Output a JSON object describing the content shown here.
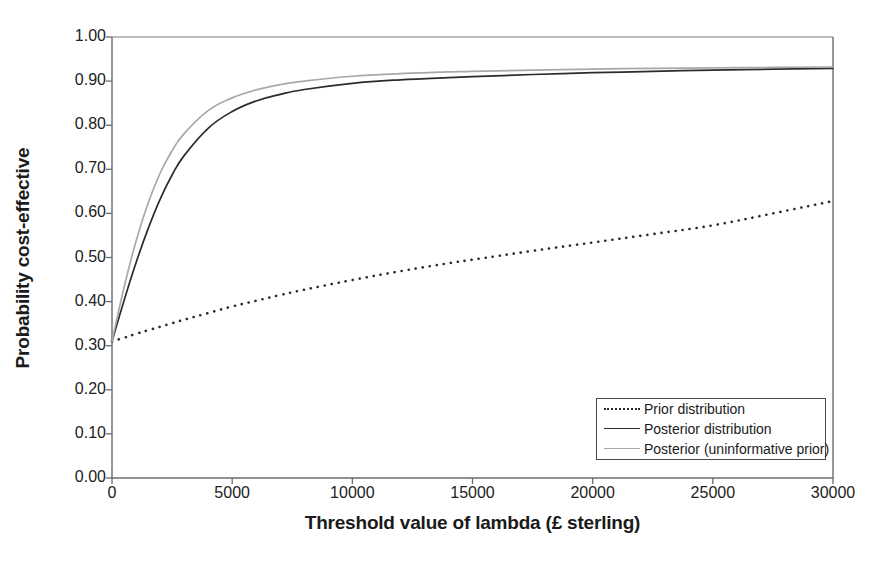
{
  "chart_data": {
    "type": "line",
    "title": "",
    "xlabel": "Threshold value of lambda (£ sterling)",
    "ylabel": "Probability cost-effective",
    "xlim": [
      0,
      30000
    ],
    "ylim": [
      0,
      1.0
    ],
    "grid": false,
    "legend_position": "bottom-right",
    "xticks": [
      0,
      5000,
      10000,
      15000,
      20000,
      25000,
      30000
    ],
    "xtick_labels": [
      "0",
      "5000",
      "10000",
      "15000",
      "20000",
      "25000",
      "30000"
    ],
    "yticks": [
      0.0,
      0.1,
      0.2,
      0.3,
      0.4,
      0.5,
      0.6,
      0.7,
      0.8,
      0.9,
      1.0
    ],
    "ytick_labels": [
      "0.00",
      "0.10",
      "0.20",
      "0.30",
      "0.40",
      "0.50",
      "0.60",
      "0.70",
      "0.80",
      "0.90",
      "1.00"
    ],
    "x": [
      0,
      500,
      1000,
      1500,
      2000,
      2500,
      3000,
      4000,
      5000,
      6000,
      7000,
      8000,
      10000,
      12000,
      14000,
      15000,
      17500,
      20000,
      22500,
      25000,
      27500,
      30000
    ],
    "series": [
      {
        "name": "Prior distribution",
        "style": "dotted",
        "color": "#2b2b2b",
        "values": [
          0.31,
          0.318,
          0.327,
          0.335,
          0.343,
          0.351,
          0.359,
          0.374,
          0.389,
          0.402,
          0.415,
          0.427,
          0.449,
          0.469,
          0.487,
          0.495,
          0.515,
          0.534,
          0.553,
          0.573,
          0.6,
          0.628
        ]
      },
      {
        "name": "Posterior distribution",
        "style": "solid",
        "color": "#2b2b2b",
        "values": [
          0.31,
          0.402,
          0.488,
          0.565,
          0.632,
          0.687,
          0.731,
          0.793,
          0.831,
          0.855,
          0.87,
          0.881,
          0.895,
          0.903,
          0.908,
          0.91,
          0.915,
          0.919,
          0.922,
          0.925,
          0.927,
          0.929
        ]
      },
      {
        "name": "Posterior (uninformative prior)",
        "style": "solid",
        "color": "#a8a8a8",
        "values": [
          0.31,
          0.432,
          0.537,
          0.623,
          0.691,
          0.742,
          0.781,
          0.833,
          0.862,
          0.88,
          0.892,
          0.9,
          0.911,
          0.917,
          0.921,
          0.922,
          0.925,
          0.927,
          0.929,
          0.93,
          0.931,
          0.932
        ]
      }
    ]
  },
  "legend": {
    "items": [
      {
        "label": "Prior distribution",
        "style": "dotted",
        "color": "#2b2b2b"
      },
      {
        "label": "Posterior distribution",
        "style": "solid",
        "color": "#2b2b2b"
      },
      {
        "label": "Posterior (uninformative prior)",
        "style": "solid",
        "color": "#a8a8a8"
      }
    ]
  },
  "axes": {
    "frame_color": "#555555",
    "background": "#ffffff"
  }
}
